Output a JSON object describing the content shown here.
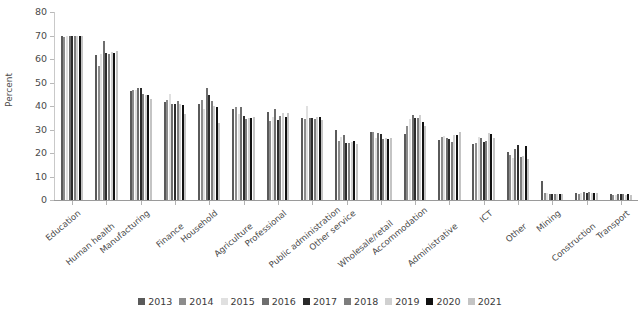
{
  "chart_data": {
    "type": "bar",
    "title": "",
    "xlabel": "",
    "ylabel": "Percent",
    "ylim": [
      0,
      80
    ],
    "yticks": [
      0,
      10,
      20,
      30,
      40,
      50,
      60,
      70,
      80
    ],
    "grid": false,
    "legend_position": "bottom",
    "categories": [
      "Education",
      "Human health",
      "Manufacturing",
      "Finance",
      "Household",
      "Agriculture",
      "Professional",
      "Public administration",
      "Other service",
      "Wholesale/retail",
      "Accommodation",
      "Administrative",
      "ICT",
      "Other",
      "Mining",
      "Construction",
      "Transport"
    ],
    "series": [
      {
        "name": "2013",
        "color": "#5a5a5a",
        "values": [
          69.8,
          61.7,
          46.6,
          41.8,
          40.8,
          38.8,
          37.6,
          34.8,
          29.6,
          28.9,
          28.0,
          25.5,
          23.8,
          20.3,
          8.2,
          3.0,
          2.5
        ]
      },
      {
        "name": "2014",
        "color": "#8c8c8c",
        "values": [
          69.5,
          57.1,
          47.0,
          42.6,
          42.7,
          39.5,
          33.6,
          34.6,
          25.3,
          29.1,
          31.5,
          26.8,
          24.2,
          19.2,
          3.0,
          2.6,
          2.3
        ]
      },
      {
        "name": "2015",
        "color": "#e0e0e0",
        "values": [
          69.6,
          62.0,
          47.0,
          45.0,
          38.7,
          36.8,
          35.5,
          40.2,
          26.9,
          26.3,
          34.5,
          27.4,
          27.0,
          17.9,
          2.8,
          3.0,
          2.2
        ]
      },
      {
        "name": "2016",
        "color": "#6e6e6e",
        "values": [
          69.7,
          67.6,
          47.6,
          41.0,
          47.5,
          39.4,
          38.6,
          35.0,
          27.7,
          28.6,
          36.0,
          26.6,
          26.5,
          21.6,
          2.6,
          3.4,
          2.7
        ]
      },
      {
        "name": "2017",
        "color": "#2b2b2b",
        "values": [
          69.9,
          62.4,
          47.7,
          40.9,
          44.6,
          35.6,
          34.1,
          34.8,
          24.3,
          28.0,
          34.9,
          26.0,
          24.6,
          23.2,
          2.6,
          3.0,
          2.5
        ]
      },
      {
        "name": "2018",
        "color": "#7d7d7d",
        "values": [
          69.6,
          62.0,
          45.3,
          42.0,
          42.2,
          34.6,
          35.6,
          34.4,
          24.3,
          25.8,
          35.0,
          24.8,
          25.3,
          18.1,
          2.5,
          3.2,
          2.4
        ]
      },
      {
        "name": "2019",
        "color": "#d0d0d0",
        "values": [
          69.7,
          62.8,
          44.5,
          41.0,
          39.8,
          35.0,
          36.9,
          35.4,
          24.8,
          26.4,
          36.2,
          27.5,
          28.4,
          18.8,
          2.5,
          2.9,
          2.3
        ]
      },
      {
        "name": "2020",
        "color": "#111111",
        "values": [
          69.9,
          62.7,
          44.8,
          40.3,
          39.6,
          34.9,
          35.4,
          35.5,
          25.0,
          26.1,
          33.0,
          27.8,
          27.9,
          23.0,
          2.6,
          3.1,
          2.6
        ]
      },
      {
        "name": "2021",
        "color": "#c4c4c4",
        "values": [
          69.6,
          63.4,
          43.1,
          36.4,
          32.7,
          35.5,
          37.0,
          34.1,
          23.9,
          26.2,
          31.4,
          29.0,
          26.5,
          17.5,
          2.4,
          2.9,
          2.1
        ]
      }
    ]
  },
  "legend": {
    "items": [
      "2013",
      "2014",
      "2015",
      "2016",
      "2017",
      "2018",
      "2019",
      "2020",
      "2021"
    ]
  }
}
